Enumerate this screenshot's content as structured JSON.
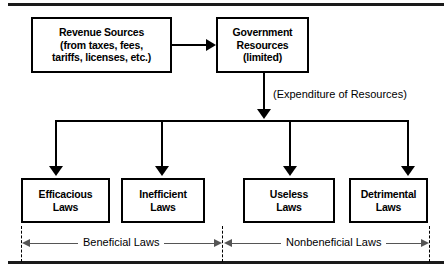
{
  "figure": {
    "top_boxes": [
      {
        "id": "revenue-sources",
        "text": "Revenue Sources\n(from taxes, fees,\ntariffs, licenses, etc.)"
      },
      {
        "id": "government-resources",
        "text": "Government\nResources\n(limited)"
      }
    ],
    "caption": "(Expenditure of Resources)",
    "law_boxes": [
      {
        "id": "efficacious-laws",
        "text": "Efficacious\nLaws"
      },
      {
        "id": "inefficient-laws",
        "text": "Inefficient\nLaws"
      },
      {
        "id": "useless-laws",
        "text": "Useless\nLaws"
      },
      {
        "id": "detrimental-laws",
        "text": "Detrimental\nLaws"
      }
    ],
    "spans": [
      {
        "id": "beneficial",
        "label": "Beneficial Laws"
      },
      {
        "id": "nonbeneficial",
        "label": "Nonbeneficial Laws"
      }
    ],
    "colors": {
      "line": "#000000",
      "rule": "#1a1a1a",
      "span_line": "#555555",
      "background": "#ffffff"
    }
  }
}
